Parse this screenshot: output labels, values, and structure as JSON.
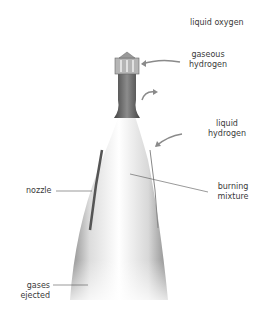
{
  "diagram": {
    "labels": {
      "liquid_oxygen": "liquid oxygen",
      "gaseous_hydrogen": "gaseous hydrogen",
      "liquid_hydrogen": "liquid hydrogen",
      "nozzle": "nozzle",
      "burning_mixture": "burning mixture",
      "gases_ejected": "gases ejected"
    },
    "label_lines": {
      "gaseous_hydrogen_1": "gaseous",
      "gaseous_hydrogen_2": "hydrogen",
      "liquid_hydrogen_1": "liquid",
      "liquid_hydrogen_2": "hydrogen",
      "burning_mixture_1": "burning",
      "burning_mixture_2": "mixture",
      "gases_ejected_1": "gases",
      "gases_ejected_2": "ejected"
    },
    "colors": {
      "background": "#ffffff",
      "text": "#3a3a3a",
      "leader_line": "#555555",
      "engine_dark": "#5a5a5a",
      "engine_mid": "#9a9a9a",
      "plume": "#f4f4f4"
    }
  }
}
